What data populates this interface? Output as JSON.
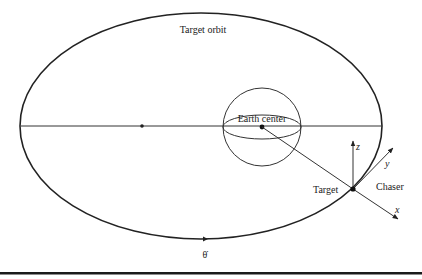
{
  "diagram": {
    "title": "Target orbit",
    "labels": {
      "orbit": "Target orbit",
      "earth_center": "Earth center",
      "target": "Target",
      "chaser": "Chaser",
      "axis_x": "x",
      "axis_y": "y",
      "axis_z": "z",
      "theta_dot": "θ̇"
    },
    "colors": {
      "stroke": "#222222",
      "background": "#ffffff",
      "rule": "#1a1a1a"
    },
    "elements": {
      "orbit_ellipse": {
        "cx": 201,
        "cy": 126,
        "rx": 181,
        "ry": 113
      },
      "apsis_line": {
        "x1": 21,
        "y1": 126,
        "x2": 382,
        "y2": 126
      },
      "empty_focus": {
        "cx": 142,
        "cy": 126
      },
      "earth": {
        "cx": 262,
        "cy": 127,
        "r": 39,
        "equator_ry": 13
      },
      "target_point": {
        "cx": 353,
        "cy": 189
      }
    }
  }
}
